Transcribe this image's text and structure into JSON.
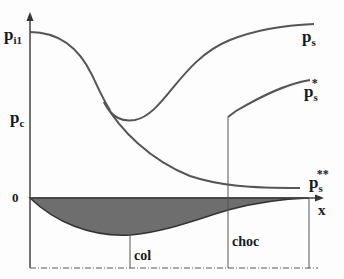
{
  "diagram": {
    "type": "nozzle-pressure-distribution",
    "axis": {
      "x_label": "x",
      "origin_label": "0"
    },
    "y_labels": {
      "inlet_pressure": "p",
      "inlet_sub": "i1",
      "critical": "p",
      "critical_sub": "c"
    },
    "curves": [
      {
        "id": "ps",
        "label": "p",
        "sub": "s",
        "sup": ""
      },
      {
        "id": "ps_star",
        "label": "p",
        "sub": "s",
        "sup": "*"
      },
      {
        "id": "ps_star2",
        "label": "p",
        "sub": "s",
        "sup": "**"
      }
    ],
    "markers": {
      "throat": "col",
      "shock": "choc"
    },
    "colors": {
      "line": "#555555",
      "fill": "#6e6e6e",
      "text": "#1a1a1a"
    }
  }
}
